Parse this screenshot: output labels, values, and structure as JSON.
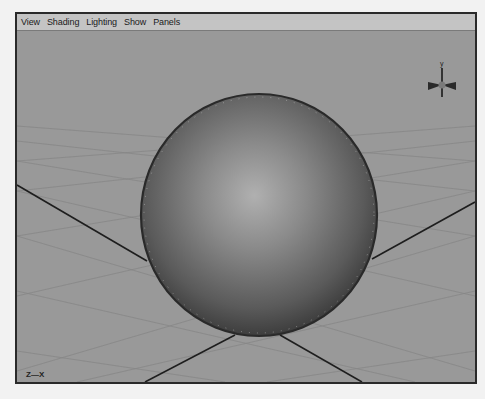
{
  "menubar": {
    "items": [
      {
        "label": "View"
      },
      {
        "label": "Shading"
      },
      {
        "label": "Lighting"
      },
      {
        "label": "Show"
      },
      {
        "label": "Panels"
      }
    ]
  },
  "viewport": {
    "camera_name": "persp",
    "axis_indicator": "Z—X",
    "view_gizmo_label": "y",
    "object": "sphere"
  },
  "colors": {
    "viewport_bg": "#999999",
    "menubar_bg": "#c4c4c4",
    "frame_border": "#2a2a2a",
    "grid_line": "#7e7e7e",
    "axis_line": "#1e1e1e"
  }
}
